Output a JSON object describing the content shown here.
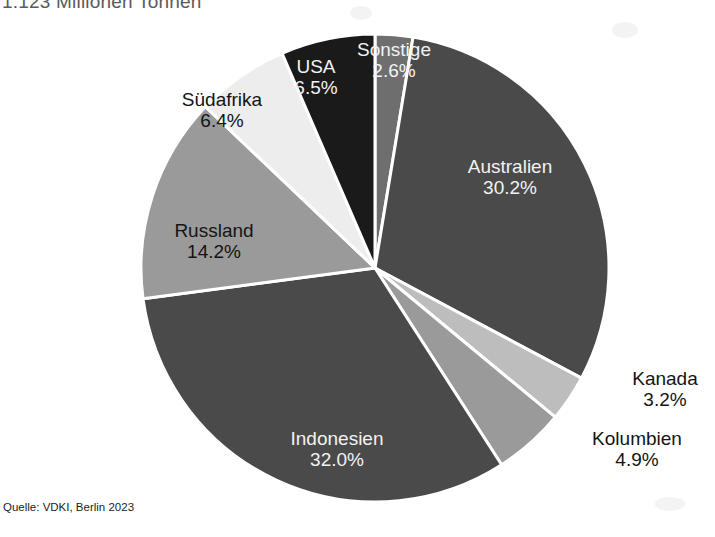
{
  "chart_data": {
    "type": "pie",
    "title": "1.123 Millionen Tonnen",
    "subtitle": "",
    "xlabel": "",
    "ylabel": "",
    "unit": "%",
    "source": "Quelle: VDKI, Berlin 2023",
    "legend": "none",
    "grid": false,
    "start_angle_deg": 0,
    "direction": "clockwise",
    "categories": [
      "Sonstige",
      "Australien",
      "Kanada",
      "Kolumbien",
      "Indonesien",
      "Russland",
      "Südafrika",
      "USA"
    ],
    "values": [
      2.6,
      30.2,
      3.2,
      4.9,
      32.0,
      14.2,
      6.4,
      6.5
    ],
    "slices": [
      {
        "label": "Sonstige",
        "value": 2.6,
        "value_text": "2.6%",
        "color": "#6e6e6e",
        "label_color": "#f2f2f2",
        "label_position": "inside"
      },
      {
        "label": "Australien",
        "value": 30.2,
        "value_text": "30.2%",
        "color": "#4a4a4a",
        "label_color": "#f2f2f2",
        "label_position": "inside"
      },
      {
        "label": "Kanada",
        "value": 3.2,
        "value_text": "3.2%",
        "color": "#bdbdbd",
        "label_color": "#141414",
        "label_position": "outside"
      },
      {
        "label": "Kolumbien",
        "value": 4.9,
        "value_text": "4.9%",
        "color": "#9a9a9a",
        "label_color": "#141414",
        "label_position": "outside"
      },
      {
        "label": "Indonesien",
        "value": 32.0,
        "value_text": "32.0%",
        "color": "#4a4a4a",
        "label_color": "#f2f2f2",
        "label_position": "inside"
      },
      {
        "label": "Russland",
        "value": 14.2,
        "value_text": "14.2%",
        "color": "#9a9a9a",
        "label_color": "#141414",
        "label_position": "inside"
      },
      {
        "label": "Südafrika",
        "value": 6.4,
        "value_text": "6.4%",
        "color": "#ededed",
        "label_color": "#141414",
        "label_position": "inside"
      },
      {
        "label": "USA",
        "value": 6.5,
        "value_text": "6.5%",
        "color": "#1a1a1a",
        "label_color": "#f2f2f2",
        "label_position": "inside"
      }
    ]
  },
  "colors": {
    "background": "#ffffff",
    "slice_border": "#ffffff",
    "title_text": "#5a5a5a",
    "source_text": "#1c1c1c",
    "label_light": "#f2f2f2",
    "label_dark": "#141414"
  }
}
